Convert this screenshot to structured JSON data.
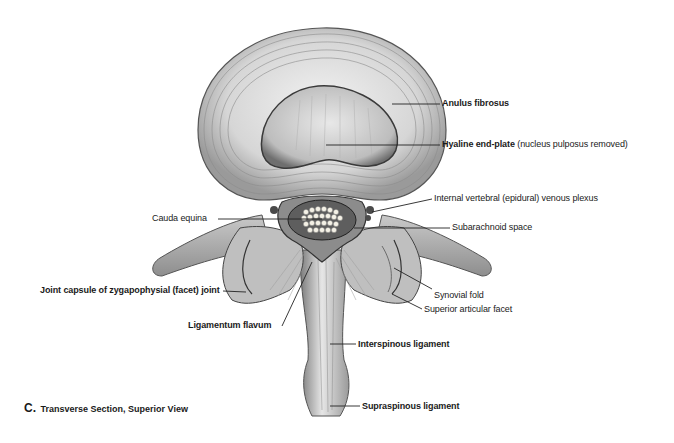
{
  "figure": {
    "caption_letter": "C.",
    "caption_text": "Transverse Section, Superior View"
  },
  "labels": [
    {
      "id": "anulus_fibrosus",
      "text": "Anulus fibrosus",
      "bold": true,
      "side": "right"
    },
    {
      "id": "hyaline_end_plate",
      "text": "Hyaline end-plate",
      "note": "(nucleus pulposus removed)",
      "bold": true,
      "side": "right"
    },
    {
      "id": "venous_plexus",
      "text": "Internal vertebral (epidural) venous plexus",
      "bold": false,
      "side": "right"
    },
    {
      "id": "cauda_equina",
      "text": "Cauda equina",
      "bold": false,
      "side": "left"
    },
    {
      "id": "subarachnoid_space",
      "text": "Subarachnoid space",
      "bold": false,
      "side": "right"
    },
    {
      "id": "joint_capsule",
      "text": "Joint capsule of zygapophysial (facet) joint",
      "bold": true,
      "side": "left"
    },
    {
      "id": "synovial_fold",
      "text": "Synovial fold",
      "bold": false,
      "side": "right"
    },
    {
      "id": "superior_articular_facet",
      "text": "Superior articular facet",
      "bold": false,
      "side": "right"
    },
    {
      "id": "ligamentum_flavum",
      "text": "Ligamentum flavum",
      "bold": true,
      "side": "left"
    },
    {
      "id": "interspinous_ligament",
      "text": "Interspinous ligament",
      "bold": true,
      "side": "right"
    },
    {
      "id": "supraspinous_ligament",
      "text": "Supraspinous ligament",
      "bold": true,
      "side": "right"
    }
  ],
  "colors": {
    "background": "#ffffff",
    "ink": "#1a1a1a",
    "bone_light": "#d9d9d9",
    "bone_mid": "#a8a8a8",
    "bone_dark": "#6e6e6e",
    "leader_line": "#222222"
  }
}
